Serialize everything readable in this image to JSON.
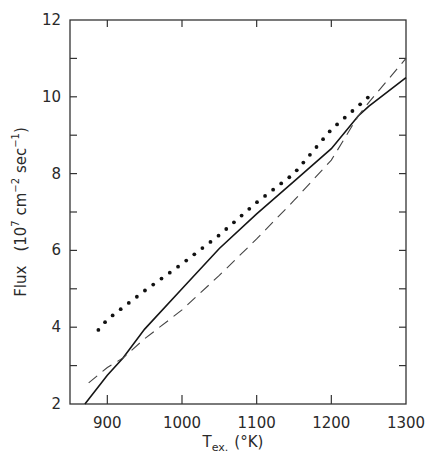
{
  "chart_data": {
    "type": "line",
    "title": "",
    "xlabel": "T_ex. (°K)",
    "xlabel_main": "T",
    "xlabel_sub": "ex.",
    "xlabel_unit": "(°K)",
    "ylabel": "Flux (10^7 cm^-2 sec^-1)",
    "ylabel_main": "Flux",
    "ylabel_unit_open": "(10",
    "ylabel_unit_exp1": "7",
    "ylabel_unit_mid": " cm",
    "ylabel_unit_exp2": "−2",
    "ylabel_unit_mid2": " sec",
    "ylabel_unit_exp3": "−1",
    "ylabel_unit_close": ")",
    "xlim": [
      850,
      1300
    ],
    "ylim": [
      2,
      12
    ],
    "x_ticks": [
      900,
      1000,
      1100,
      1200,
      1300
    ],
    "x_tick_labels": [
      "900",
      "1000",
      "1100",
      "1200",
      "1300"
    ],
    "y_ticks": [
      2,
      4,
      6,
      8,
      10,
      12
    ],
    "y_tick_labels": [
      "2",
      "4",
      "6",
      "8",
      "10",
      "12"
    ],
    "y_minor_ticks": [
      3,
      5,
      7,
      9,
      11
    ],
    "grid": false,
    "legend": null,
    "series": [
      {
        "name": "solid",
        "style": "solid",
        "x": [
          870,
          900,
          921,
          950,
          1000,
          1050,
          1100,
          1150,
          1200,
          1236,
          1250,
          1300
        ],
        "y": [
          2.0,
          2.75,
          3.2,
          3.95,
          5.0,
          6.05,
          6.95,
          7.8,
          8.65,
          9.5,
          9.75,
          10.5
        ]
      },
      {
        "name": "dashed",
        "style": "dashed",
        "x": [
          875,
          900,
          921,
          950,
          1000,
          1050,
          1100,
          1150,
          1200,
          1236,
          1250,
          1300
        ],
        "y": [
          2.55,
          2.95,
          3.2,
          3.7,
          4.45,
          5.35,
          6.3,
          7.3,
          8.35,
          9.5,
          9.85,
          11.0
        ]
      },
      {
        "name": "dotted",
        "style": "dotted",
        "x": [
          888,
          900,
          950,
          1000,
          1050,
          1100,
          1150,
          1200,
          1250
        ],
        "y": [
          3.93,
          4.2,
          4.95,
          5.65,
          6.4,
          7.25,
          8.0,
          9.15,
          10.0
        ]
      }
    ]
  }
}
